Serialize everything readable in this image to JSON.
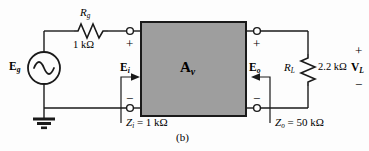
{
  "figure": {
    "caption": "(b)",
    "block_label_main": "A",
    "block_label_sub": "v",
    "block_fill": "#9e9e9e",
    "wire_color": "#1a1a1a",
    "background": "#fdfdfd"
  },
  "source": {
    "name": "source-eg",
    "label_main": "E",
    "label_sub": "g",
    "symbol": "sine-wave"
  },
  "rg": {
    "name": "resistor-rg",
    "label_main": "R",
    "label_sub": "g",
    "value": "1 kΩ"
  },
  "rl": {
    "name": "resistor-rl",
    "label_main": "R",
    "label_sub": "L",
    "value": "2.2 kΩ"
  },
  "input_port": {
    "ei_main": "E",
    "ei_sub": "i",
    "plus": "+",
    "minus": "−",
    "zi_main": "Z",
    "zi_sub": "i",
    "zi_eq": "=",
    "zi_value": "1 kΩ"
  },
  "output_port": {
    "eo_main": "E",
    "eo_sub": "o",
    "plus": "+",
    "minus": "−",
    "zo_main": "Z",
    "zo_sub": "o",
    "zo_eq": "=",
    "zo_value": "50 kΩ"
  },
  "load_voltage": {
    "vl_main": "V",
    "vl_sub": "L",
    "plus": "+",
    "minus": "−"
  },
  "ground": {
    "name": "ground-symbol"
  }
}
